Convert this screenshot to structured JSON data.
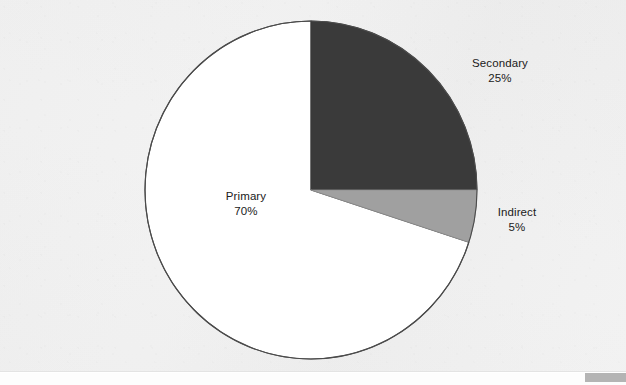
{
  "chart_data": {
    "type": "pie",
    "title": "",
    "subtitle": "",
    "xlabel": "",
    "ylabel": "",
    "legend_position": "none",
    "grid": false,
    "labels_inside": false,
    "start_angle_deg": 0,
    "direction": "clockwise",
    "categories": [
      "Secondary",
      "Indirect",
      "Primary"
    ],
    "values": [
      25,
      5,
      70
    ],
    "unit": "%",
    "slices": [
      {
        "name": "Secondary",
        "label": "Secondary",
        "value": 25,
        "value_text": "25%",
        "color": "#3a3a3a",
        "start_deg": 0,
        "end_deg": 90
      },
      {
        "name": "Indirect",
        "label": "Indirect",
        "value": 5,
        "value_text": "5%",
        "color": "#a0a0a0",
        "start_deg": 90,
        "end_deg": 108
      },
      {
        "name": "Primary",
        "label": "Primary",
        "value": 70,
        "value_text": "70%",
        "color": "#ffffff",
        "start_deg": 108,
        "end_deg": 360
      }
    ]
  },
  "colors": {
    "background": "#f2f2f2",
    "outline": "#4b4b4b",
    "text": "#202020",
    "slice_secondary": "#3a3a3a",
    "slice_indirect": "#a0a0a0",
    "slice_primary": "#ffffff",
    "page_marker": "#b4b4b4"
  },
  "geometry": {
    "center_x": 311,
    "center_y": 190,
    "radius_x": 166,
    "radius_y": 169
  }
}
